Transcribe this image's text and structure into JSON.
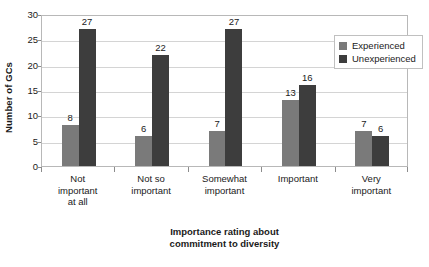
{
  "chart_data": {
    "type": "bar",
    "title": "",
    "xlabel": "Importance rating about commitment to diversity",
    "ylabel": "Number of GCs",
    "categories": [
      "Not\nimportant\nat all",
      "Not so\nimportant",
      "Somewhat\nimportant",
      "Important",
      "Very\nimportant"
    ],
    "category_lines": [
      [
        "Not",
        "important",
        "at all"
      ],
      [
        "Not so",
        "important"
      ],
      [
        "Somewhat",
        "important"
      ],
      [
        "Important"
      ],
      [
        "Very",
        "important"
      ]
    ],
    "series": [
      {
        "name": "Experienced",
        "values": [
          8,
          6,
          7,
          13,
          7
        ],
        "color": "#7a7a7a"
      },
      {
        "name": "Unexperienced",
        "values": [
          27,
          22,
          27,
          16,
          6
        ],
        "color": "#3d3d3d"
      }
    ],
    "ylim": [
      0,
      30
    ],
    "yticks": [
      0,
      5,
      10,
      15,
      20,
      25,
      30
    ],
    "ytick_labels": [
      "0",
      "5",
      "10",
      "15",
      "20",
      "25",
      "30"
    ],
    "grid": "horizontal",
    "legend_position": "top-right",
    "data_labels": true
  }
}
